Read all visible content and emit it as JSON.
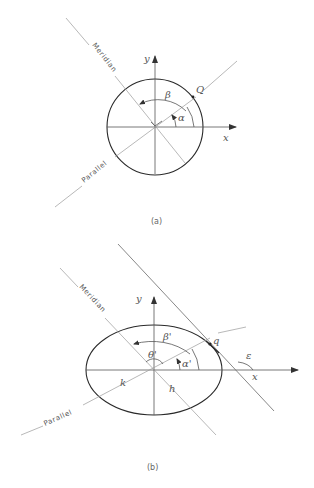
{
  "figure_a": {
    "caption": "(a)",
    "labels": {
      "meridian": "Meridian",
      "parallel": "Parallel",
      "x_axis": "x",
      "y_axis": "y",
      "point": "Q",
      "alpha": "α",
      "beta": "β"
    }
  },
  "figure_b": {
    "caption": "(b)",
    "labels": {
      "meridian": "Meridian",
      "parallel": "Parallel",
      "x_axis": "x",
      "y_axis": "y",
      "point": "q",
      "alpha": "α'",
      "beta": "β'",
      "theta": "θ'",
      "epsilon": "ε",
      "h": "h",
      "k": "k"
    }
  },
  "colors": {
    "line": "#6a6a6a",
    "outline": "#2a2a2a",
    "text": "#444444"
  }
}
